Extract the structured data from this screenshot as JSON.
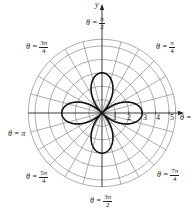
{
  "figure": {
    "type": "polar-graph",
    "center_px": [
      102,
      113
    ],
    "unit_px": 13.4,
    "grid_rings": [
      1,
      2,
      3,
      4,
      5,
      5.5
    ],
    "radial_step_deg": 15,
    "grid_color": "#8a8a8a",
    "curve_color": "#111111",
    "curve_equation": "r = 3cos(2θ)",
    "curve_petal_length": 3
  },
  "axes": {
    "x_name": "θ = 0",
    "y_name": "y",
    "x_ticks": [
      "1",
      "2",
      "3",
      "4",
      "5"
    ]
  },
  "angle_labels": {
    "pi_over_2": {
      "prefix": "θ =",
      "num": "π",
      "den": "2"
    },
    "pi_over_4": {
      "prefix": "θ =",
      "num": "π",
      "den": "4"
    },
    "three_pi_over_4": {
      "prefix": "θ =",
      "num": "3π",
      "den": "4"
    },
    "pi": {
      "text": "θ = π"
    },
    "five_pi_over_4": {
      "prefix": "θ =",
      "num": "5π",
      "den": "4"
    },
    "three_pi_over_2": {
      "prefix": "θ =",
      "num": "3π",
      "den": "2"
    },
    "seven_pi_over_4": {
      "prefix": "θ =",
      "num": "7π",
      "den": "4"
    },
    "zero": {
      "text": "θ ="
    }
  }
}
